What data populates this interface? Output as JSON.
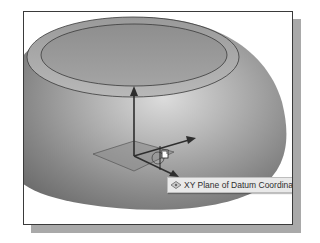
{
  "viewport": {
    "model": "dome-shell",
    "background": "#ffffff",
    "shading_highlight": "#d8d8d8",
    "shading_shadow": "#6e6e6e",
    "edge_color": "#3a3a3a"
  },
  "coordinate_system": {
    "axes": [
      "z-axis",
      "x-axis",
      "y-axis"
    ],
    "plane_highlighted": "XY"
  },
  "tooltip": {
    "icon": "datum-plane-icon",
    "text": "XY Plane of Datum Coordinat"
  }
}
